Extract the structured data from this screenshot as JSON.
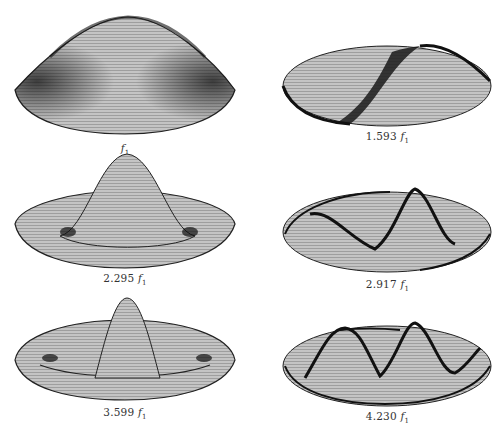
{
  "figure": {
    "panels": [
      {
        "id": "p1",
        "coef": "",
        "label_suffix": "f",
        "subscript": "1",
        "mode": "fundamental"
      },
      {
        "id": "p2",
        "coef": "1.593 ",
        "label_suffix": "f",
        "subscript": "1",
        "mode": "one-nodal-diameter"
      },
      {
        "id": "p3",
        "coef": "2.295 ",
        "label_suffix": "f",
        "subscript": "1",
        "mode": "one-nodal-circle"
      },
      {
        "id": "p4",
        "coef": "2.917 ",
        "label_suffix": "f",
        "subscript": "1",
        "mode": "two-nodal-diameters"
      },
      {
        "id": "p5",
        "coef": "3.599 ",
        "label_suffix": "f",
        "subscript": "1",
        "mode": "two-nodal-circles"
      },
      {
        "id": "p6",
        "coef": "4.230 ",
        "label_suffix": "f",
        "subscript": "1",
        "mode": "one-diameter-one-circle"
      }
    ]
  },
  "colors": {
    "mesh": "#9a9a9a",
    "fill": "#bdbdbd",
    "shade": "#1a1a1a",
    "label": "#333333"
  }
}
